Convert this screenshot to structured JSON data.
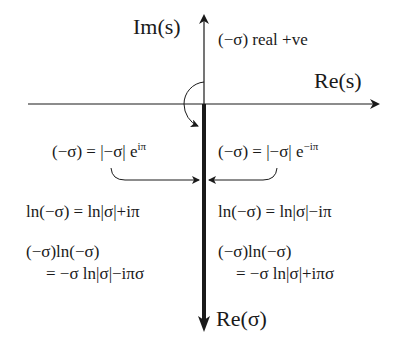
{
  "diagram": {
    "axes": {
      "imaginary_axis_label": "Im(s)",
      "real_axis_label": "Re(s)",
      "branch_axis_label": "Re(σ)"
    },
    "annotations": {
      "top_note": "(−σ) real +ve",
      "left_polar": "(−σ) = |−σ| e",
      "left_polar_exp": "iπ",
      "right_polar": "(−σ) = |−σ| e",
      "right_polar_exp": "−iπ",
      "left_log": "ln(−σ) = ln|σ|+iπ",
      "right_log": "ln(−σ) = ln|σ|−iπ",
      "left_product_line1": "(−σ)ln(−σ)",
      "left_product_line2": "= −σ ln|σ|−iπσ",
      "right_product_line1": "(−σ)ln(−σ)",
      "right_product_line2": "= −σ ln|σ|+iπσ"
    },
    "colors": {
      "ink": "#1a1a1a",
      "background": "#ffffff"
    }
  }
}
